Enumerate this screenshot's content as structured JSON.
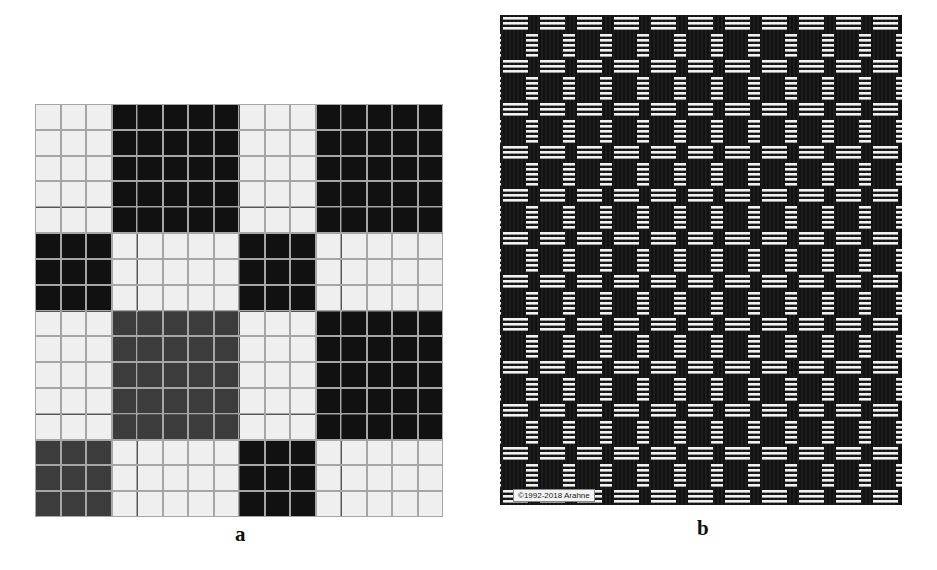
{
  "figure": {
    "panel_a": {
      "caption": "a",
      "description": "weave draft grid",
      "grid": {
        "rows": 16,
        "cols": 16,
        "row_blocks": [
          5,
          3,
          5,
          3
        ],
        "col_blocks": [
          3,
          5,
          3,
          5
        ],
        "block_fills": [
          [
            "light",
            "black",
            "light",
            "black"
          ],
          [
            "black",
            "light",
            "black",
            "light"
          ],
          [
            "light",
            "gray",
            "light",
            "black"
          ],
          [
            "gray",
            "light",
            "black",
            "light"
          ]
        ],
        "group_line_every": 4
      },
      "colors": {
        "light": "#efefef",
        "black": "#111111",
        "gray": "#3c3c3c",
        "grid_line": "#a6a6a6",
        "group_line": "#555555"
      }
    },
    "panel_b": {
      "caption": "b",
      "description": "woven fabric simulation",
      "watermark": "©1992-2018 Arahne",
      "colors": {
        "warp": "#111111",
        "weft": "#f2f2f2"
      }
    }
  }
}
